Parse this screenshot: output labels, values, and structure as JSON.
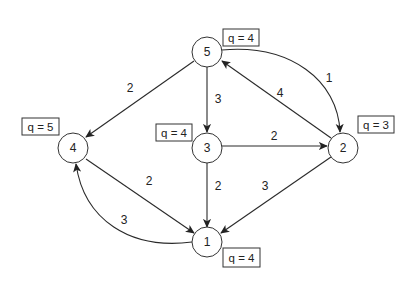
{
  "diagram": {
    "type": "directed-weighted-graph",
    "nodes": [
      {
        "id": "1",
        "label": "1",
        "q_label": "q = 4"
      },
      {
        "id": "2",
        "label": "2",
        "q_label": "q = 3"
      },
      {
        "id": "3",
        "label": "3",
        "q_label": "q = 4"
      },
      {
        "id": "4",
        "label": "4",
        "q_label": "q = 5"
      },
      {
        "id": "5",
        "label": "5",
        "q_label": "q = 4"
      }
    ],
    "edges": [
      {
        "from": "5",
        "to": "4",
        "weight": "2"
      },
      {
        "from": "5",
        "to": "3",
        "weight": "3"
      },
      {
        "from": "5",
        "to": "2",
        "weight": "1"
      },
      {
        "from": "2",
        "to": "5",
        "weight": "4"
      },
      {
        "from": "3",
        "to": "2",
        "weight": "2"
      },
      {
        "from": "3",
        "to": "1",
        "weight": "2"
      },
      {
        "from": "2",
        "to": "1",
        "weight": "3"
      },
      {
        "from": "4",
        "to": "1",
        "weight": "2"
      },
      {
        "from": "1",
        "to": "4",
        "weight": "3"
      }
    ]
  }
}
